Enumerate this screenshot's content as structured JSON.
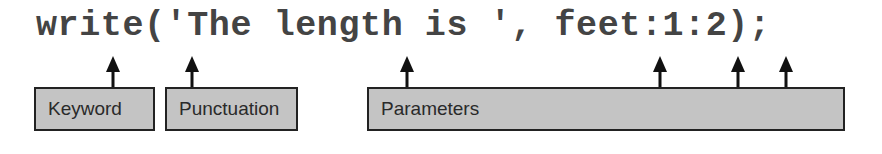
{
  "code_line": "write('The length is ', feet:1:2);",
  "labels": {
    "keyword": "Keyword",
    "punctuation": "Punctuation",
    "parameters": "Parameters"
  },
  "arrows": [
    {
      "target": "keyword",
      "points_to": "e of write",
      "x": 113
    },
    {
      "target": "punctuation",
      "points_to": "' opening quote",
      "x": 192
    },
    {
      "target": "parameters",
      "points_to": "'The length is ' string literal",
      "x": 407
    },
    {
      "target": "parameters",
      "points_to": "feet",
      "x": 660
    },
    {
      "target": "parameters",
      "points_to": "1",
      "x": 738
    },
    {
      "target": "parameters",
      "points_to": "2",
      "x": 786
    }
  ],
  "colors": {
    "box_fill": "#c4c4c4",
    "box_border": "#222222",
    "code_text": "#444444",
    "arrow": "#111111"
  }
}
